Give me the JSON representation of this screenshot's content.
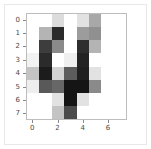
{
  "figure": {
    "type": "matplotlib-imshow-figure",
    "background_color": "#ffffff",
    "axes_edge_color": "#bdbdbd",
    "tick_color": "#4a4a4a"
  },
  "chart_data": {
    "type": "heatmap",
    "title": "",
    "xlabel": "",
    "ylabel": "",
    "colormap": "gray_r",
    "vmin": 0,
    "vmax": 16,
    "grid": false,
    "legend": "none",
    "xlim": [
      -0.5,
      7.5
    ],
    "ylim": [
      7.5,
      -0.5
    ],
    "x": [
      0,
      1,
      2,
      3,
      4,
      5,
      6,
      7
    ],
    "y": [
      0,
      1,
      2,
      3,
      4,
      5,
      6,
      7
    ],
    "xticks": [
      0,
      2,
      4,
      6
    ],
    "xtick_labels": [
      "0",
      "2",
      "4",
      "6"
    ],
    "yticks": [
      0,
      1,
      2,
      3,
      4,
      5,
      6,
      7
    ],
    "ytick_labels": [
      "0",
      "1",
      "2",
      "3",
      "4",
      "5",
      "6",
      "7"
    ],
    "values": [
      [
        0,
        0,
        4,
        0,
        3,
        8,
        0,
        0
      ],
      [
        0,
        6,
        14,
        0,
        8,
        9,
        0,
        0
      ],
      [
        0,
        13,
        9,
        0,
        14,
        6,
        0,
        0
      ],
      [
        0,
        15,
        0,
        2,
        15,
        0,
        0,
        0
      ],
      [
        5,
        15,
        0,
        11,
        15,
        3,
        0,
        0
      ],
      [
        1,
        11,
        10,
        16,
        16,
        9,
        0,
        0
      ],
      [
        0,
        0,
        2,
        16,
        3,
        0,
        0,
        0
      ],
      [
        0,
        0,
        5,
        12,
        0,
        0,
        0,
        0
      ]
    ],
    "cell_colors": [
      [
        "#ffffff",
        "#ffffff",
        "#dcdcdc",
        "#ffffff",
        "#e2e2e2",
        "#a8a8a8",
        "#ffffff",
        "#ffffff"
      ],
      [
        "#ffffff",
        "#b4b4b4",
        "#2b2b2b",
        "#ffffff",
        "#9c9c9c",
        "#909090",
        "#ffffff",
        "#ffffff"
      ],
      [
        "#ffffff",
        "#3d3d3d",
        "#8a8a8a",
        "#ffffff",
        "#2e2e2e",
        "#b4b4b4",
        "#ffffff",
        "#ffffff"
      ],
      [
        "#f2f2f2",
        "#2b2b2b",
        "#ffffff",
        "#efefef",
        "#232323",
        "#ffffff",
        "#ffffff",
        "#ffffff"
      ],
      [
        "#c4c4c4",
        "#1c1c1c",
        "#d2d2d2",
        "#5c5c5c",
        "#1f1f1f",
        "#e2e2e2",
        "#ffffff",
        "#ffffff"
      ],
      [
        "#eeeeee",
        "#595959",
        "#676767",
        "#151515",
        "#151515",
        "#8a8a8a",
        "#ffffff",
        "#ffffff"
      ],
      [
        "#ffffff",
        "#ffffff",
        "#e2e2e2",
        "#151515",
        "#e2e2e2",
        "#ffffff",
        "#ffffff",
        "#ffffff"
      ],
      [
        "#ffffff",
        "#ffffff",
        "#c4c4c4",
        "#4b4b4b",
        "#ffffff",
        "#ffffff",
        "#ffffff",
        "#ffffff"
      ]
    ]
  }
}
